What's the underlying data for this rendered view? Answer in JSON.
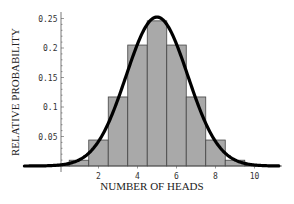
{
  "chart_data": {
    "type": "bar",
    "title": "",
    "xlabel": "NUMBER OF HEADS",
    "ylabel": "RELATIVE PROBABILITY",
    "categories": [
      0,
      1,
      2,
      3,
      4,
      5,
      6,
      7,
      8,
      9,
      10
    ],
    "values": [
      0.001,
      0.0098,
      0.044,
      0.117,
      0.205,
      0.246,
      0.205,
      0.117,
      0.044,
      0.0098,
      0.001
    ],
    "overlay": {
      "type": "line",
      "name": "Normal approximation",
      "mean": 5,
      "sd": 1.58
    },
    "x_ticks": [
      "2",
      "4",
      "6",
      "8",
      "10"
    ],
    "y_ticks": [
      "0.05",
      "0.1",
      "0.15",
      "0.2",
      "0.25"
    ],
    "xlim": [
      -0.5,
      11.3
    ],
    "ylim": [
      0,
      0.26
    ],
    "grid": false,
    "legend": "none"
  },
  "colors": {
    "bar_fill": "#a9a9a9",
    "bar_stroke": "#444444",
    "curve": "#000000",
    "axis": "#555555"
  }
}
